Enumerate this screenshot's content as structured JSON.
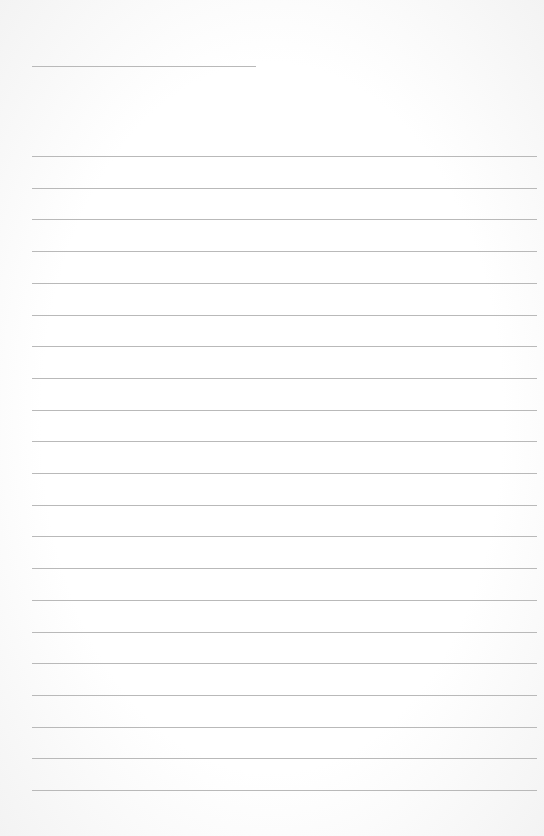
{
  "page": {
    "type": "lined-paper",
    "background_color": "#fcfcfc",
    "line_color": "#b9b9b9",
    "header_line": {
      "top": 66,
      "left": 32,
      "width": 224
    },
    "rules": {
      "count": 21,
      "first_top": 156,
      "spacing": 31.7,
      "left": 32,
      "width": 505
    }
  }
}
